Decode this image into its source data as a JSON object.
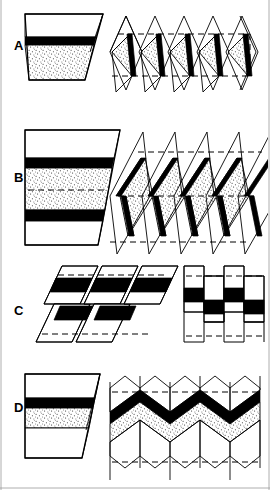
{
  "figure": {
    "width": 270,
    "height": 490,
    "background_color": "#ffffff",
    "ink_color": "#000000",
    "frame_color": "#9a9a9a"
  },
  "legend": {
    "bed_types": [
      {
        "name": "white-bed",
        "label": "White bed",
        "fill": "#ffffff"
      },
      {
        "name": "black-bed",
        "label": "Black competent bed",
        "fill": "#000000"
      },
      {
        "name": "stippled-bed",
        "label": "Stippled sandy bed",
        "fill": "#ffffff",
        "pattern": "stipple"
      }
    ],
    "line_types": [
      {
        "name": "axial-trace",
        "label": "Axial surface trace",
        "style": "dashed"
      },
      {
        "name": "bed-outline",
        "label": "Bed boundary",
        "style": "solid"
      }
    ]
  },
  "panels": [
    {
      "id": "A",
      "label": "A",
      "label_x": 14,
      "label_y": 50,
      "fold_style": "inclined-chevron",
      "block": {
        "name": "reference-block-a",
        "layers": [
          {
            "type": "white",
            "label": "upper white bed",
            "top": 14,
            "bottom": 37
          },
          {
            "type": "black",
            "label": "black marker bed",
            "top": 37,
            "bottom": 45
          },
          {
            "type": "stipple",
            "label": "stippled bed",
            "top": 45,
            "bottom": 80
          }
        ],
        "x_left": 25,
        "x_right_top": 103,
        "x_right_bottom": 90,
        "skew_top": 14,
        "skew_bottom": 22
      },
      "fold_diagram": {
        "name": "fold-train-a",
        "limb_count": 5,
        "asymmetry": "strongly asymmetric",
        "x_start": 108,
        "x_end": 262,
        "y_top": 12,
        "y_bottom": 92,
        "axial_dashes": [
          34,
          75
        ]
      }
    },
    {
      "id": "B",
      "label": "B",
      "label_x": 14,
      "label_y": 182,
      "fold_style": "inclined-similar",
      "block": {
        "name": "reference-block-b",
        "layers": [
          {
            "type": "white",
            "label": "upper white bed",
            "top": 130,
            "bottom": 158
          },
          {
            "type": "black",
            "label": "upper black bed",
            "top": 158,
            "bottom": 168
          },
          {
            "type": "stipple",
            "label": "stippled bed",
            "top": 168,
            "bottom": 210
          },
          {
            "type": "black",
            "label": "lower black bed",
            "top": 210,
            "bottom": 221
          },
          {
            "type": "white",
            "label": "lower white bed",
            "top": 221,
            "bottom": 245
          }
        ],
        "x_left": 25,
        "x_right_top": 120,
        "x_right_bottom": 98,
        "axial_dash_y": 190
      },
      "fold_diagram": {
        "name": "fold-train-b",
        "limb_count": 5,
        "asymmetry": "overturned, steeply inclined",
        "x_start": 108,
        "x_end": 265,
        "y_top": 128,
        "y_bottom": 248,
        "axial_dashes": [
          152,
          196,
          240
        ]
      }
    },
    {
      "id": "C",
      "label": "C",
      "label_x": 14,
      "label_y": 315,
      "fold_style": "kink-and-box",
      "left_diagram": {
        "name": "kink-band-train-c",
        "limb_count": 3,
        "x_start": 40,
        "x_end": 160,
        "y_top": 262,
        "y_bottom": 348,
        "axial_dashes": [
          275,
          336
        ]
      },
      "right_diagram": {
        "name": "box-fold-train-c",
        "limb_count": 4,
        "x_start": 175,
        "x_end": 260,
        "y_top": 262,
        "y_bottom": 348,
        "axial_dashes": [
          276,
          336
        ]
      }
    },
    {
      "id": "D",
      "label": "D",
      "label_x": 14,
      "label_y": 412,
      "fold_style": "symmetric-chevron",
      "block": {
        "name": "reference-block-d",
        "layers": [
          {
            "type": "white",
            "label": "upper white bed",
            "top": 374,
            "bottom": 398
          },
          {
            "type": "black",
            "label": "black marker bed",
            "top": 398,
            "bottom": 408
          },
          {
            "type": "stipple",
            "label": "stippled bed",
            "top": 408,
            "bottom": 428
          },
          {
            "type": "white",
            "label": "lower white bed",
            "top": 428,
            "bottom": 458
          }
        ],
        "x_left": 25,
        "x_right_top": 100,
        "x_right_bottom": 82
      },
      "fold_diagram": {
        "name": "fold-train-d",
        "limb_count": 5,
        "asymmetry": "upright symmetric",
        "x_start": 110,
        "x_end": 262,
        "y_top": 372,
        "y_bottom": 480,
        "axial_dashes": [
          392,
          462
        ]
      }
    }
  ]
}
